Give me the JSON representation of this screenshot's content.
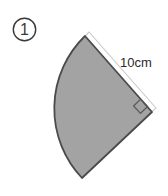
{
  "figure": {
    "problem_marker": {
      "number": "1",
      "style": "circled",
      "icon": "circled-number-one-icon"
    },
    "shape": {
      "name": "sector",
      "description": "shaded circular sector",
      "fill_color": "#a3a3a3",
      "stroke_color": "#4a4a4a",
      "central_angle_degrees": 90,
      "right_angle_mark": true
    },
    "dimension": {
      "label": "10cm",
      "value": 10,
      "unit": "cm",
      "measures": "radius",
      "arc_color": "#c9c9c9"
    },
    "background_color": "#ffffff"
  }
}
